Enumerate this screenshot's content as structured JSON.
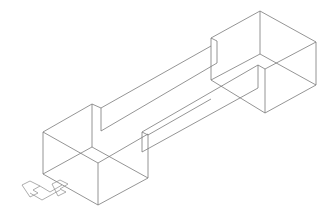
{
  "drawing": {
    "background": "#ffffff",
    "line_color": "#7a7a7a",
    "objects": [
      {
        "name": "left-box"
      },
      {
        "name": "right-box"
      },
      {
        "name": "connecting-beam"
      },
      {
        "name": "ucs-icon"
      }
    ]
  }
}
